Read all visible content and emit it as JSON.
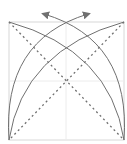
{
  "diagram": {
    "type": "origami-fold-diagram",
    "colors": {
      "border": "#d8d8d8",
      "guide": "#e6e6e6",
      "arc": "#707070",
      "dashed": "#707070",
      "arrow": "#707070"
    },
    "elements": [
      "square-outline",
      "center-guides",
      "diagonal-dashed-lines",
      "fold-arcs",
      "fold-arrows"
    ]
  }
}
